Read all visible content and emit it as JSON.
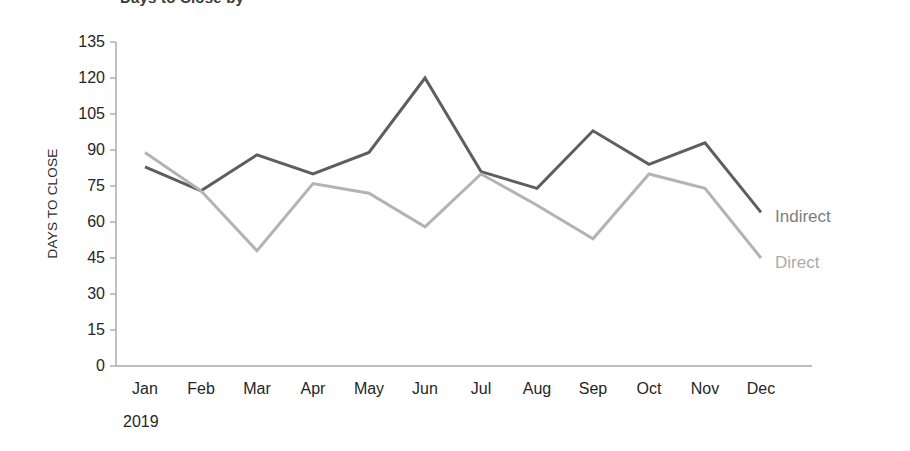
{
  "figure": {
    "clipped_title_fragment": "Days to Close by",
    "background_color": "#ffffff"
  },
  "axes": {
    "y_axis_title": "DAYS TO CLOSE",
    "y_ticks": [
      135,
      120,
      105,
      90,
      75,
      60,
      45,
      30,
      15,
      0
    ],
    "y_min": 0,
    "y_max": 135,
    "x_year_label": "2019",
    "axis_line_color": "#a6a6a6"
  },
  "legend": {
    "position": "right-of-plot-end-labels",
    "entries": [
      {
        "label": "Indirect",
        "color": "#5e5e5e"
      },
      {
        "label": "Direct",
        "color": "#b3b3b3"
      }
    ]
  },
  "chart_data": {
    "type": "line",
    "title": "Days to Close by",
    "xlabel": "2019",
    "ylabel": "DAYS TO CLOSE",
    "ylim": [
      0,
      135
    ],
    "ytick_step": 15,
    "grid": false,
    "legend_position": "right",
    "categories": [
      "Jan",
      "Feb",
      "Mar",
      "Apr",
      "May",
      "Jun",
      "Jul",
      "Aug",
      "Sep",
      "Oct",
      "Nov",
      "Dec"
    ],
    "series": [
      {
        "name": "Indirect",
        "color": "#5e5e5e",
        "values": [
          83,
          73,
          88,
          80,
          89,
          120,
          81,
          74,
          98,
          84,
          93,
          64
        ]
      },
      {
        "name": "Direct",
        "color": "#b3b3b3",
        "values": [
          89,
          73,
          48,
          76,
          72,
          58,
          80,
          67,
          53,
          80,
          74,
          45
        ]
      }
    ]
  }
}
